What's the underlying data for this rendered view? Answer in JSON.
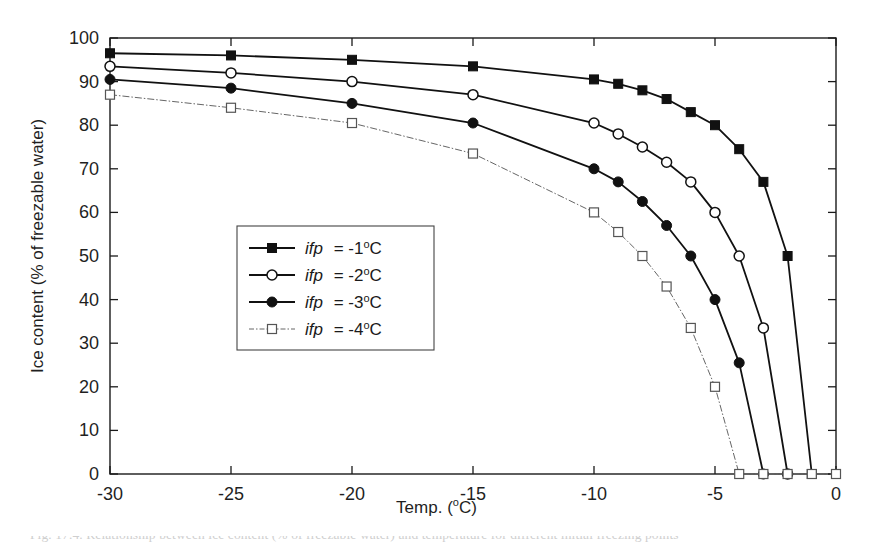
{
  "figure": {
    "caption": "Fig. 17.4.  Relationship between ice content (% of freezable water) and temperature for different initial freezing points"
  },
  "chart_data": {
    "type": "line",
    "title": "",
    "xlabel": "Temp. (°C)",
    "ylabel": "Ice content (% of freezable water)",
    "xlim": [
      -30,
      0
    ],
    "ylim": [
      0,
      100
    ],
    "xticks": [
      -30,
      -25,
      -20,
      -15,
      -10,
      -5,
      0
    ],
    "xticklabels": [
      "-30",
      "-25",
      "-20",
      "-15",
      "-10",
      "-5",
      "0"
    ],
    "yticks": [
      0,
      10,
      20,
      30,
      40,
      50,
      60,
      70,
      80,
      90,
      100
    ],
    "yticklabels": [
      "0",
      "10",
      "20",
      "30",
      "40",
      "50",
      "60",
      "70",
      "80",
      "90",
      "100"
    ],
    "grid": false,
    "legend_position": "center-left",
    "series": [
      {
        "name": "ifp  =  -1°C",
        "marker": "filled-square",
        "linestyle": "solid",
        "color": "#000000",
        "x": [
          -30,
          -25,
          -20,
          -15,
          -10,
          -9,
          -8,
          -7,
          -6,
          -5,
          -4,
          -3,
          -2,
          -1
        ],
        "y": [
          96.5,
          96,
          95,
          93.5,
          90.5,
          89.5,
          88,
          86,
          83,
          80,
          74.5,
          67,
          50,
          0
        ]
      },
      {
        "name": "ifp  =  -2°C",
        "marker": "open-circle",
        "linestyle": "solid",
        "color": "#000000",
        "x": [
          -30,
          -25,
          -20,
          -15,
          -10,
          -9,
          -8,
          -7,
          -6,
          -5,
          -4,
          -3,
          -2
        ],
        "y": [
          93.5,
          92,
          90,
          87,
          80.5,
          78,
          75,
          71.5,
          67,
          60,
          50,
          33.5,
          0
        ]
      },
      {
        "name": "ifp  =  -3°C",
        "marker": "filled-circle",
        "linestyle": "solid",
        "color": "#000000",
        "x": [
          -30,
          -25,
          -20,
          -15,
          -10,
          -9,
          -8,
          -7,
          -6,
          -5,
          -4,
          -3
        ],
        "y": [
          90.5,
          88.5,
          85,
          80.5,
          70,
          67,
          62.5,
          57,
          50,
          40,
          25.5,
          0
        ]
      },
      {
        "name": "ifp  =  -4°C",
        "marker": "open-square",
        "linestyle": "dashdot-thin",
        "color": "#555555",
        "x": [
          -30,
          -25,
          -20,
          -15,
          -10,
          -9,
          -8,
          -7,
          -6,
          -5,
          -4,
          -3,
          -2,
          -1,
          0
        ],
        "y": [
          87,
          84,
          80.5,
          73.5,
          60,
          55.5,
          50,
          43,
          33.5,
          20,
          0,
          0,
          0,
          0,
          0
        ]
      }
    ],
    "legend": [
      {
        "label_italic": "ifp",
        "label_rest": "=  -1",
        "unit": "o",
        "unit_tail": "C",
        "marker": "filled-square"
      },
      {
        "label_italic": "ifp",
        "label_rest": "=  -2",
        "unit": "o",
        "unit_tail": "C",
        "marker": "open-circle"
      },
      {
        "label_italic": "ifp",
        "label_rest": "=  -3",
        "unit": "o",
        "unit_tail": "C",
        "marker": "filled-circle"
      },
      {
        "label_italic": "ifp",
        "label_rest": "=  -4",
        "unit": "o",
        "unit_tail": "C",
        "marker": "open-square"
      }
    ]
  },
  "axis_titles": {
    "x_main": "Temp. (",
    "x_sup": "o",
    "x_tail": "C)",
    "y_full": "Ice content (% of freezable water)"
  }
}
